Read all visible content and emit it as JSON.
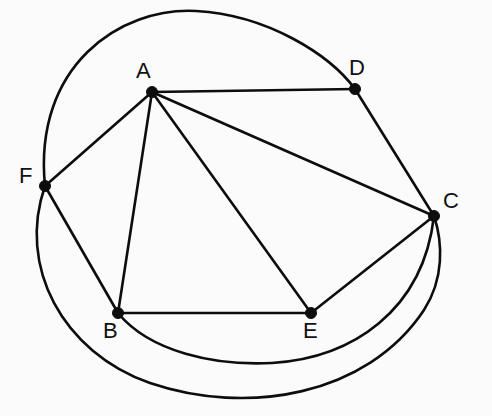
{
  "diagram": {
    "background_color": "#fbfbfb",
    "stroke_color": "#0d0d0d",
    "label_color": "#111111",
    "width": 492,
    "height": 416
  },
  "vertices": [
    {
      "id": "A",
      "label": "A",
      "x": 152,
      "y": 92,
      "label_x": 136,
      "label_y": 60,
      "degree": 5
    },
    {
      "id": "B",
      "label": "B",
      "x": 118,
      "y": 313,
      "label_x": 103,
      "label_y": 320,
      "degree": 4
    },
    {
      "id": "C",
      "label": "C",
      "x": 434,
      "y": 216,
      "label_x": 443,
      "label_y": 190,
      "degree": 5
    },
    {
      "id": "D",
      "label": "D",
      "x": 355,
      "y": 89,
      "label_x": 349,
      "label_y": 57,
      "degree": 3
    },
    {
      "id": "E",
      "label": "E",
      "x": 311,
      "y": 313,
      "label_x": 303,
      "label_y": 320,
      "degree": 3
    },
    {
      "id": "F",
      "label": "F",
      "x": 45,
      "y": 186,
      "label_x": 19,
      "label_y": 165,
      "degree": 4
    }
  ],
  "edges": [
    {
      "id": "A-D",
      "from": "A",
      "to": "D",
      "kind": "straight",
      "path": "M 152 92 L 355 89"
    },
    {
      "id": "A-C",
      "from": "A",
      "to": "C",
      "kind": "straight",
      "path": "M 152 92 L 434 216"
    },
    {
      "id": "A-E",
      "from": "A",
      "to": "E",
      "kind": "straight",
      "path": "M 152 92 L 311 313"
    },
    {
      "id": "A-B",
      "from": "A",
      "to": "B",
      "kind": "straight",
      "path": "M 152 92 L 118 313"
    },
    {
      "id": "A-F",
      "from": "A",
      "to": "F",
      "kind": "straight",
      "path": "M 152 92 L 45 186"
    },
    {
      "id": "D-C",
      "from": "D",
      "to": "C",
      "kind": "straight",
      "path": "M 355 89 L 434 216"
    },
    {
      "id": "C-E",
      "from": "C",
      "to": "E",
      "kind": "straight",
      "path": "M 434 216 L 311 313"
    },
    {
      "id": "B-E",
      "from": "B",
      "to": "E",
      "kind": "straight",
      "path": "M 118 313 L 311 313"
    },
    {
      "id": "B-F",
      "from": "B",
      "to": "F",
      "kind": "straight",
      "path": "M 118 313 L 45 186"
    },
    {
      "id": "F-D",
      "from": "F",
      "to": "D",
      "kind": "curve",
      "path": "M 45 186 C 33 66 120 7 196 11 C 268 15 330 55 355 89"
    },
    {
      "id": "B-C",
      "from": "B",
      "to": "C",
      "kind": "curve",
      "path": "M 118 313 C 150 352 215 366 272 363 C 352 358 423 311 434 216"
    },
    {
      "id": "F-C",
      "from": "F",
      "to": "C",
      "kind": "curve",
      "path": "M 45 186 C 17 266 62 352 150 383 C 247 416 367 396 424 310 C 444 279 443 243 434 216"
    }
  ],
  "edge_list_text": [
    "AB",
    "AC",
    "AD",
    "AE",
    "AF",
    "BC",
    "BE",
    "BF",
    "CD",
    "CE",
    "CF"
  ]
}
